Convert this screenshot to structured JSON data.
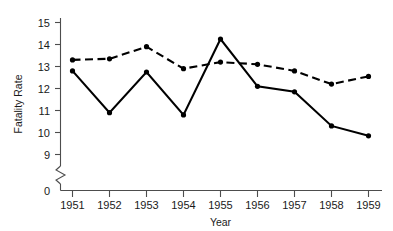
{
  "chart_data": {
    "type": "line",
    "title": "",
    "xlabel": "Year",
    "ylabel": "Fatality Rate",
    "categories": [
      "1951",
      "1952",
      "1953",
      "1954",
      "1955",
      "1956",
      "1957",
      "1958",
      "1959"
    ],
    "x": [
      1951,
      1952,
      1953,
      1954,
      1955,
      1956,
      1957,
      1958,
      1959
    ],
    "series": [
      {
        "name": "solid-line-series",
        "style": "solid",
        "color": "#000000",
        "marker": "filled-circle",
        "values": [
          12.8,
          10.9,
          12.75,
          10.8,
          14.25,
          12.1,
          11.85,
          10.3,
          9.85
        ]
      },
      {
        "name": "dashed-line-series",
        "style": "dashed",
        "color": "#000000",
        "marker": "filled-circle",
        "values": [
          13.3,
          13.35,
          13.9,
          12.9,
          13.2,
          13.1,
          12.8,
          12.2,
          12.55
        ]
      }
    ],
    "ylim": [
      9,
      15
    ],
    "yticks": [
      "0",
      "9",
      "10",
      "11",
      "12",
      "13",
      "14",
      "15"
    ],
    "ytick_values": [
      0,
      9,
      10,
      11,
      12,
      13,
      14,
      15
    ],
    "xticks": [
      "1951",
      "1952",
      "1953",
      "1954",
      "1955",
      "1956",
      "1957",
      "1958",
      "1959"
    ],
    "axis_break": true,
    "axis_break_label": "y-axis-break",
    "grid": false,
    "legend": "none"
  },
  "axes": {
    "y_label": "Fatality Rate",
    "x_label": "Year",
    "y_tick_labels": [
      "15",
      "14",
      "13",
      "12",
      "11",
      "10",
      "9",
      "0"
    ],
    "x_tick_labels": [
      "1951",
      "1952",
      "1953",
      "1954",
      "1955",
      "1956",
      "1957",
      "1958",
      "1959"
    ]
  },
  "colors": {
    "line": "#000000",
    "axis": "#4d4d4d",
    "text": "#1a1a1a",
    "background": "#ffffff"
  }
}
